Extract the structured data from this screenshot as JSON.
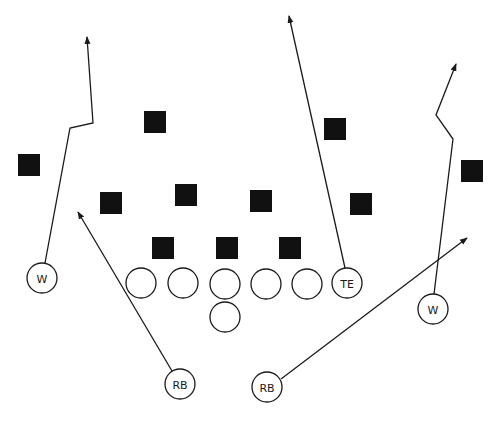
{
  "diagram": {
    "type": "football-play",
    "width": 498,
    "height": 421,
    "colors": {
      "ink": "#1a1a1a",
      "background": "#ffffff",
      "defender": "#111111"
    },
    "offense": [
      {
        "id": "w-left",
        "label": "W",
        "x": 42,
        "y": 278,
        "r": 15
      },
      {
        "id": "ol-1",
        "label": "",
        "x": 141,
        "y": 283,
        "r": 15
      },
      {
        "id": "ol-2",
        "label": "",
        "x": 183,
        "y": 283,
        "r": 15
      },
      {
        "id": "ol-center",
        "label": "",
        "x": 225,
        "y": 284,
        "r": 15
      },
      {
        "id": "ol-4",
        "label": "",
        "x": 266,
        "y": 284,
        "r": 15
      },
      {
        "id": "ol-5",
        "label": "",
        "x": 307,
        "y": 284,
        "r": 15
      },
      {
        "id": "qb",
        "label": "",
        "x": 225,
        "y": 317,
        "r": 15
      },
      {
        "id": "te",
        "label": "TE",
        "x": 347,
        "y": 283,
        "r": 15
      },
      {
        "id": "w-right",
        "label": "W",
        "x": 433,
        "y": 309,
        "r": 15
      },
      {
        "id": "rb-left",
        "label": "RB",
        "x": 180,
        "y": 384,
        "r": 15
      },
      {
        "id": "rb-right",
        "label": "RB",
        "x": 267,
        "y": 387,
        "r": 15
      }
    ],
    "defense": [
      {
        "id": "d-1",
        "x": 29,
        "y": 165
      },
      {
        "id": "d-2",
        "x": 155,
        "y": 122
      },
      {
        "id": "d-3",
        "x": 111,
        "y": 203
      },
      {
        "id": "d-4",
        "x": 186,
        "y": 195
      },
      {
        "id": "d-5",
        "x": 261,
        "y": 201
      },
      {
        "id": "d-6",
        "x": 335,
        "y": 129
      },
      {
        "id": "d-7",
        "x": 361,
        "y": 204
      },
      {
        "id": "d-8",
        "x": 472,
        "y": 171
      },
      {
        "id": "d-9",
        "x": 163,
        "y": 248
      },
      {
        "id": "d-10",
        "x": 227,
        "y": 248
      },
      {
        "id": "d-11",
        "x": 290,
        "y": 248
      }
    ],
    "defender_size": 22,
    "routes": [
      {
        "id": "route-w-left",
        "from": "w-left",
        "points": [
          [
            45,
            263
          ],
          [
            70,
            128
          ],
          [
            93,
            123
          ],
          [
            87,
            37
          ]
        ]
      },
      {
        "id": "route-rb-left",
        "from": "rb-left",
        "points": [
          [
            172,
            371
          ],
          [
            78,
            212
          ]
        ]
      },
      {
        "id": "route-te",
        "from": "te",
        "points": [
          [
            345,
            268
          ],
          [
            289,
            16
          ]
        ]
      },
      {
        "id": "route-w-right",
        "from": "w-right",
        "points": [
          [
            434,
            294
          ],
          [
            453,
            139
          ],
          [
            436,
            115
          ],
          [
            456,
            64
          ]
        ]
      },
      {
        "id": "route-rb-right",
        "from": "rb-right",
        "points": [
          [
            281,
            379
          ],
          [
            467,
            238
          ]
        ]
      }
    ]
  }
}
